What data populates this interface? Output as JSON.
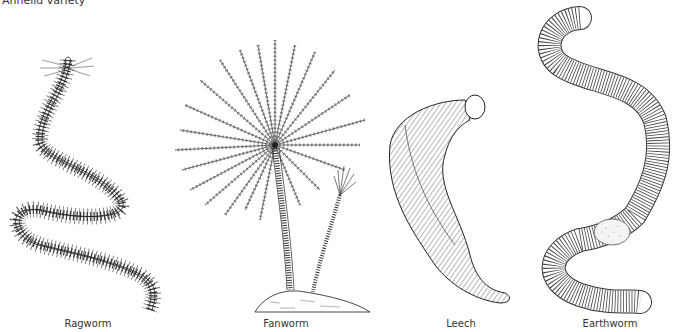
{
  "title": "Annelid variety",
  "figures": [
    {
      "label": "Ragworm",
      "icon": "ragworm-illustration"
    },
    {
      "label": "Fanworm",
      "icon": "fanworm-illustration"
    },
    {
      "label": "Leech",
      "icon": "leech-illustration"
    },
    {
      "label": "Earthworm",
      "icon": "earthworm-illustration"
    }
  ],
  "colors": {
    "ink": "#2a2a2a",
    "background": "#ffffff"
  }
}
